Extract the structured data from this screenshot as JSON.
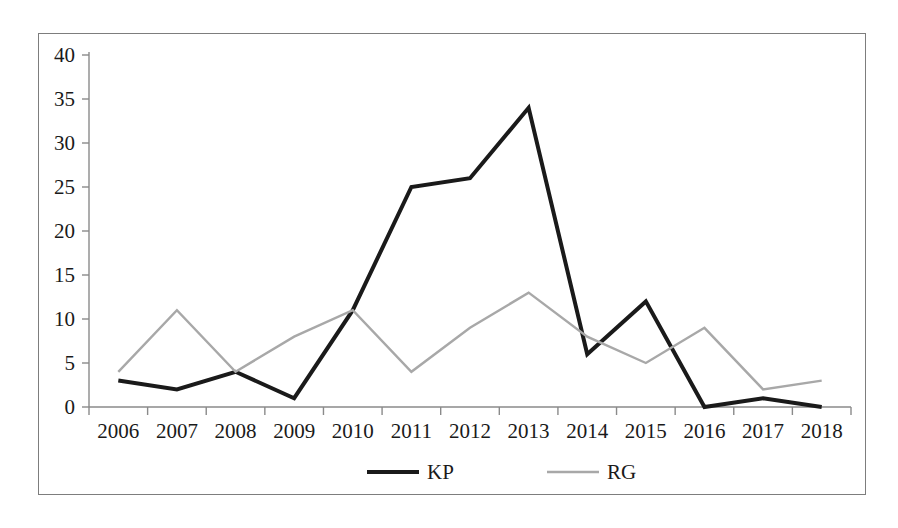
{
  "chart_data": {
    "type": "line",
    "title": "",
    "xlabel": "",
    "ylabel": "",
    "categories": [
      "2006",
      "2007",
      "2008",
      "2009",
      "2010",
      "2011",
      "2012",
      "2013",
      "2014",
      "2015",
      "2016",
      "2017",
      "2018"
    ],
    "series": [
      {
        "name": "KP",
        "color": "#1a1a1a",
        "line_width": 4,
        "values": [
          3,
          2,
          4,
          1,
          11,
          25,
          26,
          34,
          6,
          12,
          0,
          1,
          0
        ]
      },
      {
        "name": "RG",
        "color": "#a8a8a8",
        "line_width": 2.4,
        "values": [
          4,
          11,
          4,
          8,
          11,
          4,
          9,
          13,
          8,
          5,
          9,
          2,
          3
        ]
      }
    ],
    "ylim": [
      0,
      40
    ],
    "ytick_values": [
      0,
      5,
      10,
      15,
      20,
      25,
      30,
      35,
      40
    ],
    "ytick_labels": [
      "0",
      "5",
      "10",
      "15",
      "20",
      "25",
      "30",
      "35",
      "40"
    ],
    "grid": false,
    "legend_position": "bottom",
    "legend_entries": [
      {
        "label": "KP",
        "color": "#1a1a1a",
        "line_width": 4
      },
      {
        "label": "RG",
        "color": "#a8a8a8",
        "line_width": 2.4
      }
    ],
    "axis_color": "#8a8a8a",
    "border_color": "#7d7d7d",
    "background_color": "#ffffff"
  }
}
